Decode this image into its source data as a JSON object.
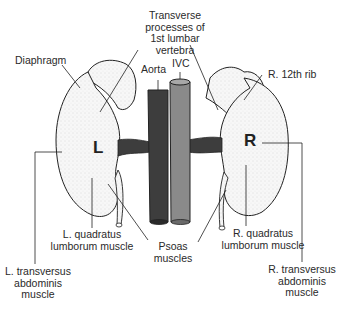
{
  "diagram": {
    "colors": {
      "aorta": "#3d3d3d",
      "ivc": "#8a8a8a",
      "outline": "#222222",
      "background": "#ffffff"
    },
    "kidney_left_letter": "L",
    "kidney_right_letter": "R",
    "labels": {
      "transverse_1": "Transverse",
      "transverse_2": "processes of",
      "transverse_3": "1st lumbar",
      "transverse_4": "vertebra",
      "diaphragm": "Diaphragm",
      "aorta": "Aorta",
      "ivc": "IVC",
      "rib": "R. 12th rib",
      "lql_1": "L. quadratus",
      "lql_2": "lumborum muscle",
      "rql_1": "R. quadratus",
      "rql_2": "lumborum muscle",
      "psoas_1": "Psoas",
      "psoas_2": "muscles",
      "lta_1": "L. transversus",
      "lta_2": "abdominis",
      "lta_3": "muscle",
      "rta_1": "R. transversus",
      "rta_2": "abdominis",
      "rta_3": "muscle"
    }
  }
}
